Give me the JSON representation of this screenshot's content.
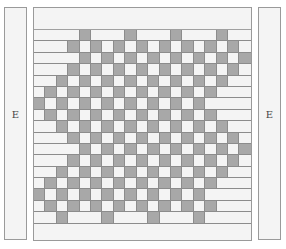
{
  "side_panels": {
    "left_label": "E",
    "right_label": "E"
  },
  "grid": {
    "columns": 19,
    "rows_count": 17,
    "colors": {
      "grey": "#a8a8a8",
      "white": "#f4f4f4",
      "line": "#8c8c8c"
    },
    "legend": {
      "G": "grey cell",
      "w": "white cell",
      "-": "white float bar"
    },
    "rows": [
      "----G---G---G---G--",
      "---GwGwGwGwGwGwGwGw",
      "----GwGwGwGwGwGwGwG",
      "---GwGwGwGwGwGwGwGw",
      "--GwGwGwGwGwGwGwG--",
      "wGwGwGwGwGwGwGwG---",
      "GwGwGwGwGwGwGwG----",
      "wGwGwGwGwGwGwGwG---",
      "--GwGwGwGwGwGwGwG--",
      "---GwGwGwGwGwGwGwGw",
      "----GwGwGwGwGwGwGwG",
      "---GwGwGwGwGwGwGwGw",
      "--GwGwGwGwGwGwGwG--",
      "wGwGwGwGwGwGwGwG---",
      "GwGwGwGwGwGwGwG----",
      "wGwGwGwGwGwGwGwG---",
      "--G---G---G---G----"
    ]
  }
}
